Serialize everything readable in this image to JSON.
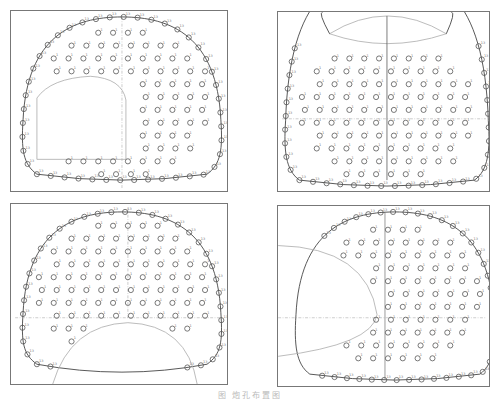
{
  "figure": {
    "caption": "图    炮孔布置图",
    "panels": [
      {
        "id": "top-left",
        "description": "Full section with left pilot heading cut-out",
        "hole_label": "1"
      },
      {
        "id": "top-right",
        "description": "Lower section under excavated upper arch",
        "hole_label": "1"
      },
      {
        "id": "bottom-left",
        "description": "Upper section above lower excavated arch",
        "hole_label": "1"
      },
      {
        "id": "bottom-right",
        "description": "Right section beside left excavated area",
        "hole_label": "1"
      }
    ],
    "perimeter_label": "13",
    "colors": {
      "outline": "#444444",
      "hole": "#555555",
      "frame": "#777777"
    }
  }
}
